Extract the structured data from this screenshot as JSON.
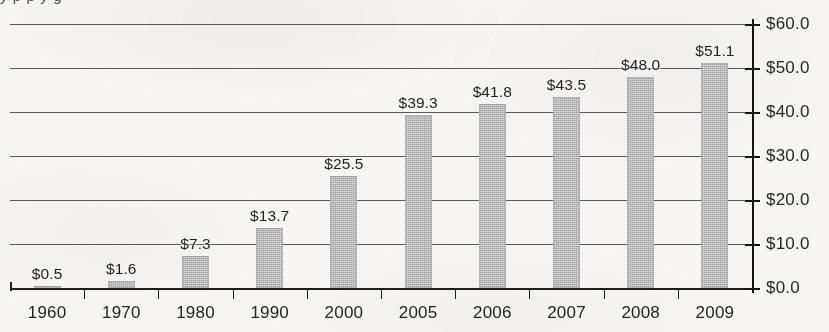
{
  "chart_data": {
    "type": "bar",
    "title": "",
    "subtitle": "",
    "xlabel": "",
    "ylabel": "",
    "categories": [
      "1960",
      "1970",
      "1980",
      "1990",
      "2000",
      "2005",
      "2006",
      "2007",
      "2008",
      "2009"
    ],
    "values": [
      0.5,
      1.6,
      7.3,
      13.7,
      25.5,
      39.3,
      41.8,
      43.5,
      48.0,
      51.1
    ],
    "value_labels": [
      "$0.5",
      "$1.6",
      "$7.3",
      "$13.7",
      "$25.5",
      "$39.3",
      "$41.8",
      "$43.5",
      "$48.0",
      "$51.1"
    ],
    "ylim": [
      0,
      60
    ],
    "ytick_values": [
      0,
      10,
      20,
      30,
      40,
      50,
      60
    ],
    "ytick_labels": [
      "$0.0",
      "$10.0",
      "$20.0",
      "$30.0",
      "$40.0",
      "$50.0",
      "$60.0"
    ],
    "y_axis_position": "right",
    "grid": true,
    "grid_axis": "y",
    "legend": "none",
    "bar_color": "#a2a2a2",
    "bar_pattern": "dither-halftone",
    "axis_color": "#1d1d1d",
    "text_color": "#222222",
    "background_color": "#f6f5f2",
    "value_labels_shown": true
  },
  "artifacts": {
    "cropped_title_descenders": "y   p    p y      g"
  }
}
